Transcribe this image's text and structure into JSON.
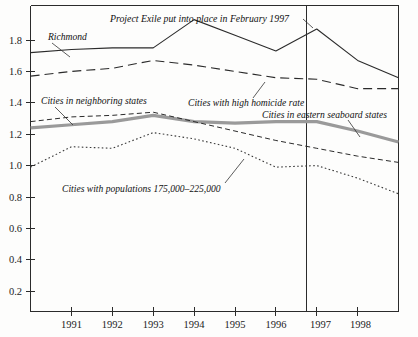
{
  "chart_data": {
    "type": "line",
    "title": "",
    "xlabel": "",
    "ylabel": "",
    "xlim": [
      1990,
      1999
    ],
    "ylim": [
      0.0,
      1.95
    ],
    "grid": false,
    "legend": "inline-annotations",
    "x_tick_labels": [
      "1991",
      "1992",
      "1993",
      "1994",
      "1995",
      "1996",
      "1997",
      "1998"
    ],
    "x_tick_values": [
      1991,
      1992,
      1993,
      1994,
      1995,
      1996,
      1997,
      1998
    ],
    "y_tick_labels": [
      "0.2",
      "0.4",
      "0.6",
      "0.8",
      "1.0",
      "1.2",
      "1.4",
      "1.6",
      "1.8"
    ],
    "y_tick_values": [
      0.2,
      0.4,
      0.6,
      0.8,
      1.0,
      1.2,
      1.4,
      1.6,
      1.8
    ],
    "x": [
      1990,
      1991,
      1992,
      1993,
      1994,
      1995,
      1996,
      1997,
      1998,
      1999
    ],
    "annotations": [
      {
        "name": "project-exile",
        "text": "Project Exile put into place in February 1997",
        "x_value": 1996.75,
        "style": "vertical-rule-with-leader"
      }
    ],
    "series": [
      {
        "name": "Richmond",
        "label": "Richmond",
        "style": "solid",
        "color": "#2b2b2b",
        "width": 1.1,
        "values": [
          1.65,
          1.67,
          1.68,
          1.68,
          1.86,
          1.76,
          1.66,
          1.8,
          1.6,
          1.49
        ]
      },
      {
        "name": "Cities with high homicide rate",
        "label": "Cities with high homicide rate",
        "style": "long-dash",
        "color": "#2b2b2b",
        "width": 1.1,
        "values": [
          1.5,
          1.53,
          1.55,
          1.6,
          1.57,
          1.53,
          1.49,
          1.48,
          1.42,
          1.42
        ]
      },
      {
        "name": "Cities in neighboring states",
        "label": "Cities in neighboring states",
        "style": "short-dash",
        "color": "#2b2b2b",
        "width": 1.0,
        "values": [
          1.21,
          1.24,
          1.25,
          1.27,
          1.21,
          1.15,
          1.09,
          1.04,
          0.99,
          0.95
        ]
      },
      {
        "name": "Cities in eastern seaboard states",
        "label": "Cities in eastern seaboard states",
        "style": "thick-solid-gray",
        "color": "#9a9a9a",
        "width": 3.2,
        "values": [
          1.17,
          1.19,
          1.21,
          1.25,
          1.21,
          1.2,
          1.21,
          1.21,
          1.15,
          1.08
        ]
      },
      {
        "name": "Cities with populations 175,000-225,000",
        "label": "Cities with populations 175,000–225,000",
        "style": "dotted",
        "color": "#3a3a3a",
        "width": 1.1,
        "values": [
          0.92,
          1.05,
          1.04,
          1.14,
          1.1,
          1.04,
          0.92,
          0.93,
          0.85,
          0.75
        ]
      }
    ]
  },
  "labels": {
    "title_annotation": "Project Exile put into place in February 1997",
    "richmond": "Richmond",
    "neighboring": "Cities in neighboring states",
    "high_homicide": "Cities with high homicide rate",
    "eastern_seaboard": "Cities in eastern seaboard states",
    "populations": "Cities with populations 175,000–225,000"
  },
  "axis": {
    "y_ticks": [
      "1.8",
      "1.6",
      "1.4",
      "1.2",
      "1.0",
      "0.8",
      "0.6",
      "0.4",
      "0.2"
    ],
    "x_ticks": [
      "1991",
      "1992",
      "1993",
      "1994",
      "1995",
      "1996",
      "1997",
      "1998"
    ]
  }
}
